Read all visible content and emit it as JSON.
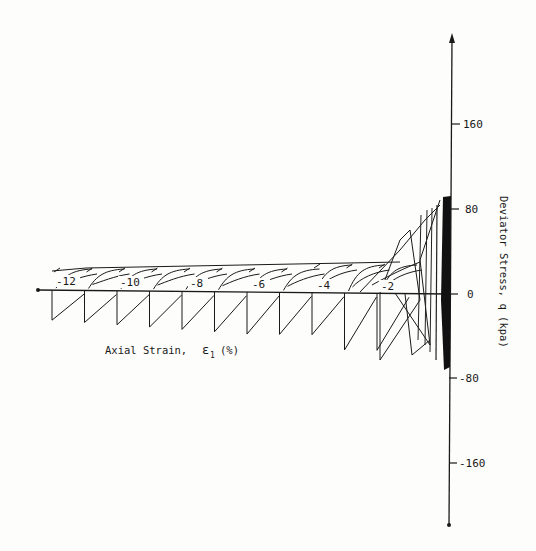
{
  "chart_data": {
    "type": "line",
    "title": "",
    "xlabel": "Axial Strain, ε1 (%)",
    "ylabel": "Deviator Stress, q (kpa)",
    "x_ticks": [
      -12,
      -10,
      -8,
      -6,
      -4,
      -2
    ],
    "y_ticks": [
      160,
      80,
      0,
      -80,
      -160
    ],
    "xlim": [
      -13,
      0
    ],
    "ylim": [
      -200,
      200
    ],
    "grid": false,
    "legend": null,
    "series": [
      {
        "name": "cyclic response",
        "approx_peak_q_kpa": 90,
        "approx_trough_q_kpa": -85,
        "note": "loops tighten near 0% strain (dense dark band between -80 and +90 kPa) and spread out as strain accumulates; upper plateau ~ +25 kPa, lower ~ -25 to -45 kPa"
      }
    ]
  },
  "labels": {
    "x_axis_title": "Axial Strain,",
    "x_axis_symbol": "ε",
    "x_axis_sub": "1",
    "x_axis_unit": "(%)",
    "y_axis_title": "Deviator Stress, q (kpa)",
    "x_ticks": [
      "-12",
      "-10",
      "-8",
      "-6",
      "-4",
      "-2"
    ],
    "y_ticks": [
      "160",
      "80",
      "0",
      "-80",
      "-160"
    ]
  }
}
